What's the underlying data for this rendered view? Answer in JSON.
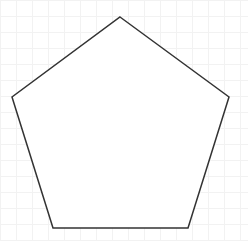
{
  "diagram": {
    "shape": "pentagon",
    "stroke_color": "#333333",
    "fill_color": "#ffffff",
    "background": "#ffffff",
    "grid_color": "#f2f2f2",
    "grid_spacing": 16,
    "vertices": [
      [
        120,
        17
      ],
      [
        229,
        97
      ],
      [
        188,
        228
      ],
      [
        53,
        228
      ],
      [
        12,
        97
      ]
    ]
  }
}
